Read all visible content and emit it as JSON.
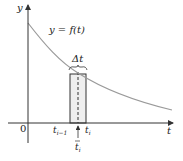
{
  "figure": {
    "axis_labels": {
      "y": "y",
      "x": "t",
      "origin": "0"
    },
    "curve_label": "y = f(t)",
    "interval_label": "Δt",
    "tick_labels": {
      "left": "t",
      "left_sub": "i−1",
      "right": "t",
      "right_sub": "i",
      "sample": "t",
      "sample_sub": "i"
    },
    "colors": {
      "axis": "#333333",
      "curve": "#9a9a9a",
      "rect_fill": "#f0f0f0",
      "rect_stroke": "#333333"
    }
  }
}
